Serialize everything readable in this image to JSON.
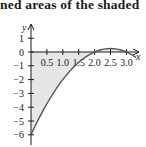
{
  "caption": {
    "text": "ned areas of the shaded"
  },
  "chart_data": {
    "type": "line",
    "title": "",
    "function": "y = -x^2 + 5x - 6",
    "xlabel": "x",
    "ylabel": "y",
    "xlim": [
      0,
      3.4
    ],
    "ylim": [
      -6.5,
      1.5
    ],
    "x_ticks": [
      0.5,
      1.0,
      1.5,
      2.0,
      2.5,
      3.0
    ],
    "x_tick_labels": [
      "0.5",
      "1.0",
      "1.5",
      "2.0",
      "2.5",
      "3.0"
    ],
    "y_ticks": [
      1,
      0,
      -1,
      -2,
      -3,
      -4,
      -5,
      -6
    ],
    "y_tick_labels": [
      "1",
      "0",
      "−1",
      "−2",
      "−3",
      "−4",
      "−5",
      "−6"
    ],
    "series": [
      {
        "name": "curve",
        "x": [
          0,
          0.5,
          1.0,
          1.5,
          2.0,
          2.5,
          3.0,
          3.3
        ],
        "y": [
          -6,
          -3.75,
          -2,
          -0.75,
          0,
          0.25,
          0,
          -0.39
        ]
      }
    ],
    "shaded_regions": [
      {
        "from_x": 0,
        "to_x": 2,
        "between": "curve and x-axis"
      },
      {
        "from_x": 2,
        "to_x": 3,
        "between": "curve and x-axis"
      }
    ],
    "grid": false,
    "colors": {
      "curve": "#555555",
      "fill": "#e6e6e6",
      "axis": "#1a1a1a"
    }
  }
}
